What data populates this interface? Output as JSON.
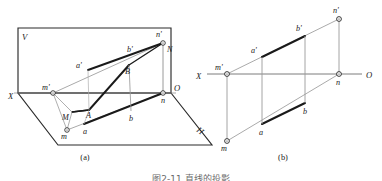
{
  "figure": {
    "caption_cut_off": "图2-11  直线的投影",
    "sub_captions": {
      "a": "(a)",
      "b": "(b)"
    }
  },
  "pictorial": {
    "planes": {
      "v_label": "V",
      "h_label": "H"
    },
    "axis": {
      "x_label": "X",
      "o_label": "O"
    },
    "points": [
      {
        "id": "m-prime",
        "label": "m'",
        "x": 53,
        "y": 93,
        "lx": 42,
        "ly": 90,
        "marker": true
      },
      {
        "id": "n-prime",
        "label": "n'",
        "x": 163,
        "y": 43,
        "lx": 158,
        "ly": 37,
        "marker": true
      },
      {
        "id": "m",
        "label": "m",
        "x": 67,
        "y": 130,
        "lx": 63,
        "ly": 139,
        "marker": true
      },
      {
        "id": "n",
        "label": "n",
        "x": 163,
        "y": 93,
        "lx": 163,
        "ly": 103,
        "marker": true
      },
      {
        "id": "a-prime",
        "label": "a'",
        "x": 88,
        "y": 70,
        "lx": 78,
        "ly": 68,
        "marker": false
      },
      {
        "id": "b-prime",
        "label": "b'",
        "x": 140,
        "y": 55,
        "lx": 128,
        "ly": 52,
        "marker": false
      },
      {
        "id": "a",
        "label": "a",
        "x": 84,
        "y": 124,
        "lx": 84,
        "ly": 133,
        "marker": false
      },
      {
        "id": "b",
        "label": "b",
        "x": 131,
        "y": 111,
        "lx": 131,
        "ly": 120,
        "marker": false
      },
      {
        "id": "point-A",
        "label": "A",
        "x": 89,
        "y": 110,
        "lx": 88,
        "ly": 117,
        "marker": false
      },
      {
        "id": "point-B",
        "label": "B",
        "x": 129,
        "y": 65,
        "lx": 127,
        "ly": 73,
        "marker": false
      },
      {
        "id": "point-M",
        "label": "M",
        "x": 72,
        "y": 112,
        "lx": 62,
        "ly": 119,
        "marker": false
      },
      {
        "id": "point-N",
        "label": "N",
        "x": 163,
        "y": 43,
        "lx": 167,
        "ly": 51,
        "marker": false
      }
    ]
  },
  "orthographic": {
    "axis": {
      "x_label": "X",
      "o_label": "O"
    },
    "points": [
      {
        "id": "m-prime",
        "label": "m'",
        "x": 227,
        "y": 74,
        "lx": 217,
        "ly": 69,
        "marker": true
      },
      {
        "id": "n-prime",
        "label": "n'",
        "x": 339,
        "y": 19,
        "lx": 334,
        "ly": 12,
        "marker": true
      },
      {
        "id": "m",
        "label": "m",
        "x": 227,
        "y": 141,
        "lx": 223,
        "ly": 150,
        "marker": true
      },
      {
        "id": "n",
        "label": "n",
        "x": 339,
        "y": 74,
        "lx": 338,
        "ly": 84,
        "marker": true
      },
      {
        "id": "a-prime",
        "label": "a'",
        "x": 262,
        "y": 57,
        "lx": 252,
        "ly": 53,
        "marker": false
      },
      {
        "id": "b-prime",
        "label": "b'",
        "x": 305,
        "y": 36,
        "lx": 297,
        "ly": 31,
        "marker": false
      },
      {
        "id": "a",
        "label": "a",
        "x": 262,
        "y": 124,
        "lx": 261,
        "ly": 134,
        "marker": false
      },
      {
        "id": "b",
        "label": "b",
        "x": 305,
        "y": 103,
        "lx": 305,
        "ly": 113,
        "marker": false
      }
    ]
  }
}
